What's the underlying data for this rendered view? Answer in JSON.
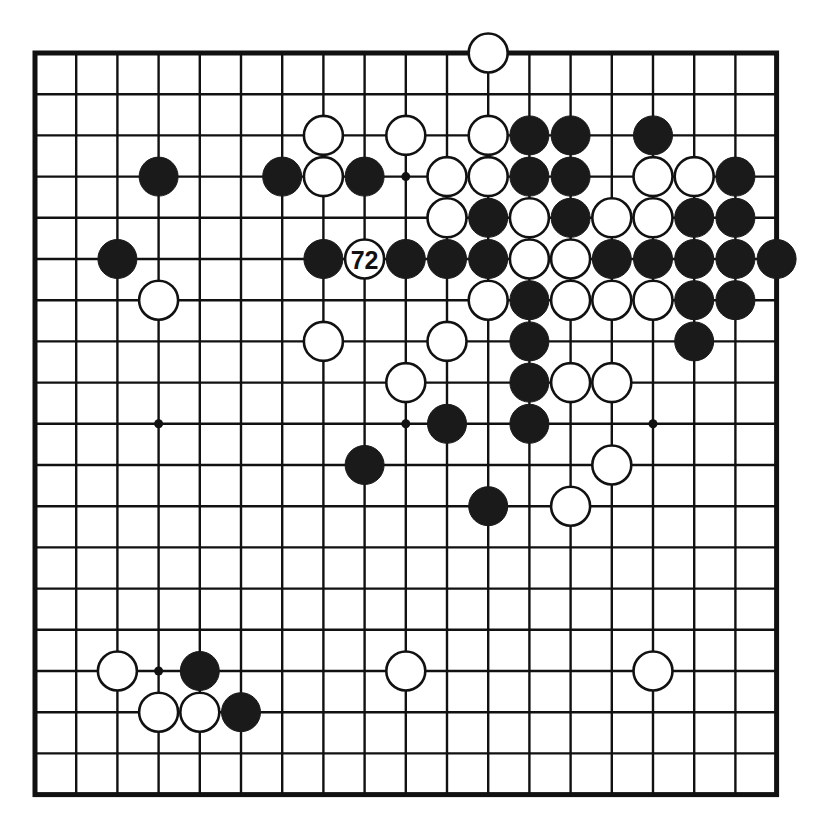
{
  "diagram": {
    "board_size": 19,
    "colors": {
      "black_stone": "#1a1a1a",
      "white_stone": "#ffffff",
      "line": "#111111",
      "background": "#ffffff"
    },
    "geometry": {
      "origin_x": 35,
      "origin_y": 53,
      "spacing": 41.2,
      "stone_radius": 19.5,
      "hoshi_radius": 4.5
    },
    "hoshi_points": [
      [
        3,
        3
      ],
      [
        9,
        3
      ],
      [
        15,
        3
      ],
      [
        3,
        9
      ],
      [
        9,
        9
      ],
      [
        15,
        9
      ],
      [
        3,
        15
      ],
      [
        9,
        15
      ],
      [
        15,
        15
      ]
    ],
    "move_marker": {
      "label": "72",
      "col": 8,
      "row": 5,
      "color": "white"
    },
    "stones": [
      {
        "col": 11,
        "row": 0,
        "color": "white"
      },
      {
        "col": 7,
        "row": 2,
        "color": "white"
      },
      {
        "col": 9,
        "row": 2,
        "color": "white"
      },
      {
        "col": 11,
        "row": 2,
        "color": "white"
      },
      {
        "col": 12,
        "row": 2,
        "color": "black"
      },
      {
        "col": 13,
        "row": 2,
        "color": "black"
      },
      {
        "col": 15,
        "row": 2,
        "color": "black"
      },
      {
        "col": 3,
        "row": 3,
        "color": "black"
      },
      {
        "col": 6,
        "row": 3,
        "color": "black"
      },
      {
        "col": 7,
        "row": 3,
        "color": "white"
      },
      {
        "col": 8,
        "row": 3,
        "color": "black"
      },
      {
        "col": 10,
        "row": 3,
        "color": "white"
      },
      {
        "col": 11,
        "row": 3,
        "color": "white"
      },
      {
        "col": 12,
        "row": 3,
        "color": "black"
      },
      {
        "col": 13,
        "row": 3,
        "color": "black"
      },
      {
        "col": 15,
        "row": 3,
        "color": "white"
      },
      {
        "col": 16,
        "row": 3,
        "color": "white"
      },
      {
        "col": 17,
        "row": 3,
        "color": "black"
      },
      {
        "col": 10,
        "row": 4,
        "color": "white"
      },
      {
        "col": 11,
        "row": 4,
        "color": "black"
      },
      {
        "col": 12,
        "row": 4,
        "color": "white"
      },
      {
        "col": 13,
        "row": 4,
        "color": "black"
      },
      {
        "col": 14,
        "row": 4,
        "color": "white"
      },
      {
        "col": 15,
        "row": 4,
        "color": "white"
      },
      {
        "col": 16,
        "row": 4,
        "color": "black"
      },
      {
        "col": 17,
        "row": 4,
        "color": "black"
      },
      {
        "col": 2,
        "row": 5,
        "color": "black"
      },
      {
        "col": 7,
        "row": 5,
        "color": "black"
      },
      {
        "col": 9,
        "row": 5,
        "color": "black"
      },
      {
        "col": 10,
        "row": 5,
        "color": "black"
      },
      {
        "col": 11,
        "row": 5,
        "color": "black"
      },
      {
        "col": 12,
        "row": 5,
        "color": "white"
      },
      {
        "col": 13,
        "row": 5,
        "color": "white"
      },
      {
        "col": 14,
        "row": 5,
        "color": "black"
      },
      {
        "col": 15,
        "row": 5,
        "color": "black"
      },
      {
        "col": 16,
        "row": 5,
        "color": "black"
      },
      {
        "col": 17,
        "row": 5,
        "color": "black"
      },
      {
        "col": 18,
        "row": 5,
        "color": "black"
      },
      {
        "col": 3,
        "row": 6,
        "color": "white"
      },
      {
        "col": 11,
        "row": 6,
        "color": "white"
      },
      {
        "col": 12,
        "row": 6,
        "color": "black"
      },
      {
        "col": 13,
        "row": 6,
        "color": "white"
      },
      {
        "col": 14,
        "row": 6,
        "color": "white"
      },
      {
        "col": 15,
        "row": 6,
        "color": "white"
      },
      {
        "col": 16,
        "row": 6,
        "color": "black"
      },
      {
        "col": 17,
        "row": 6,
        "color": "black"
      },
      {
        "col": 7,
        "row": 7,
        "color": "white"
      },
      {
        "col": 10,
        "row": 7,
        "color": "white"
      },
      {
        "col": 12,
        "row": 7,
        "color": "black"
      },
      {
        "col": 16,
        "row": 7,
        "color": "black"
      },
      {
        "col": 9,
        "row": 8,
        "color": "white"
      },
      {
        "col": 12,
        "row": 8,
        "color": "black"
      },
      {
        "col": 13,
        "row": 8,
        "color": "white"
      },
      {
        "col": 14,
        "row": 8,
        "color": "white"
      },
      {
        "col": 10,
        "row": 9,
        "color": "black"
      },
      {
        "col": 12,
        "row": 9,
        "color": "black"
      },
      {
        "col": 8,
        "row": 10,
        "color": "black"
      },
      {
        "col": 14,
        "row": 10,
        "color": "white"
      },
      {
        "col": 11,
        "row": 11,
        "color": "black"
      },
      {
        "col": 13,
        "row": 11,
        "color": "white"
      },
      {
        "col": 2,
        "row": 15,
        "color": "white"
      },
      {
        "col": 4,
        "row": 15,
        "color": "black"
      },
      {
        "col": 9,
        "row": 15,
        "color": "white"
      },
      {
        "col": 15,
        "row": 15,
        "color": "white"
      },
      {
        "col": 3,
        "row": 16,
        "color": "white"
      },
      {
        "col": 4,
        "row": 16,
        "color": "white"
      },
      {
        "col": 5,
        "row": 16,
        "color": "black"
      }
    ]
  }
}
